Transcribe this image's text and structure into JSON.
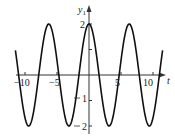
{
  "chart_data": {
    "type": "line",
    "title": "",
    "xlabel": "t",
    "ylabel": "y1",
    "xlim": [
      -12,
      12
    ],
    "ylim": [
      -2,
      2
    ],
    "x_ticks": [
      -10,
      -5,
      5,
      10
    ],
    "y_ticks": [
      2,
      1,
      -1,
      -2
    ],
    "x_tick_labels": [
      "−10",
      "−5",
      "5",
      "10"
    ],
    "y_tick_labels": [
      "2",
      "1",
      "1",
      "2"
    ],
    "grid": false,
    "legend": null,
    "series": [
      {
        "name": "y1 = 2 cos t",
        "function": "2*cos(t)",
        "x": [
          -11.5,
          -9.42,
          -6.28,
          -3.14,
          0,
          3.14,
          6.28,
          9.42,
          11.5
        ],
        "values": [
          1.02,
          -2,
          2,
          -2,
          2,
          -2,
          2,
          -2,
          1.02
        ]
      }
    ],
    "colors": {
      "curve": "#111111",
      "axes": "#333333"
    }
  },
  "axes": {
    "x_label": "t",
    "y_label_main": "y",
    "y_label_sub": "1"
  }
}
